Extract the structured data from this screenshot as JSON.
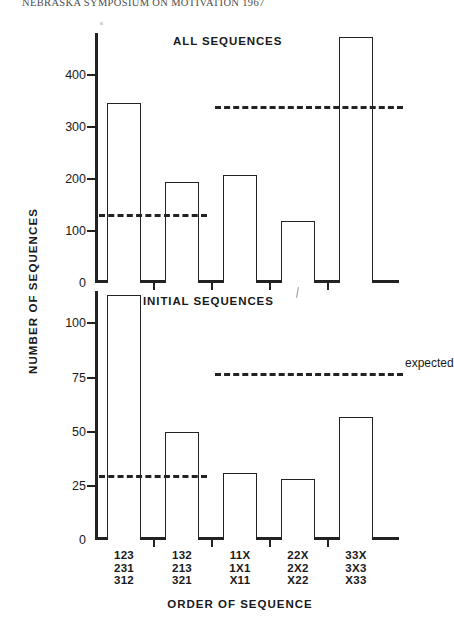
{
  "running_head": "NEBRASKA SYMPOSIUM ON MOTIVATION 1967",
  "axis_titles": {
    "y": "NUMBER OF SEQUENCES",
    "x": "ORDER OF SEQUENCE"
  },
  "categories": [
    {
      "lines": [
        "123",
        "231",
        "312"
      ]
    },
    {
      "lines": [
        "132",
        "213",
        "321"
      ]
    },
    {
      "lines": [
        "11X",
        "1X1",
        "X11"
      ]
    },
    {
      "lines": [
        "22X",
        "2X2",
        "X22"
      ]
    },
    {
      "lines": [
        "33X",
        "3X3",
        "X33"
      ]
    }
  ],
  "chart_data": [
    {
      "type": "bar",
      "title": "ALL SEQUENCES",
      "xlabel": "ORDER OF SEQUENCE",
      "ylabel": "NUMBER OF SEQUENCES",
      "categories": [
        "123 231 312",
        "132 213 321",
        "11X 1X1 X11",
        "22X 2X2 X22",
        "33X 3X3 X33"
      ],
      "values": [
        345,
        193,
        208,
        120,
        472
      ],
      "ylim": [
        0,
        480
      ],
      "yticks": [
        0,
        100,
        200,
        300,
        400
      ],
      "ytick_labels": [
        "0",
        "100",
        "200",
        "300",
        "400"
      ],
      "grid": false,
      "legend": "none",
      "annotations": [
        {
          "name": "expected-left",
          "type": "hline",
          "value": 133,
          "x_start_category": 0,
          "x_end_category": 1,
          "style": "dashed"
        },
        {
          "name": "expected-right",
          "type": "hline",
          "value": 340,
          "x_start_category": 2,
          "x_end_category": 4,
          "style": "dashed"
        }
      ]
    },
    {
      "type": "bar",
      "title": "INITIAL SEQUENCES",
      "xlabel": "ORDER OF SEQUENCE",
      "ylabel": "NUMBER OF SEQUENCES",
      "categories": [
        "123 231 312",
        "132 213 321",
        "11X 1X1 X11",
        "22X 2X2 X22",
        "33X 3X3 X33"
      ],
      "values": [
        113,
        50,
        31,
        28,
        57
      ],
      "ylim": [
        0,
        115
      ],
      "yticks": [
        0,
        25,
        50,
        75,
        100
      ],
      "ytick_labels": [
        "0",
        "25",
        "50",
        "75",
        "100"
      ],
      "grid": false,
      "legend": "none",
      "annotations": [
        {
          "name": "expected-left",
          "type": "hline",
          "value": 30,
          "x_start_category": 0,
          "x_end_category": 1,
          "style": "dashed"
        },
        {
          "name": "expected-right",
          "type": "hline",
          "value": 77,
          "x_start_category": 2,
          "x_end_category": 4,
          "style": "dashed",
          "label": "expected"
        }
      ]
    }
  ],
  "labels": {
    "expected": "expected",
    "title_all": "ALL SEQUENCES",
    "title_initial": "INITIAL SEQUENCES"
  },
  "colors": {
    "ink": "#222222",
    "paper": "#ffffff"
  }
}
